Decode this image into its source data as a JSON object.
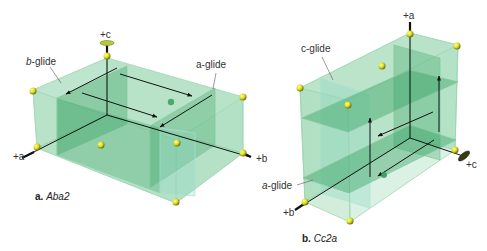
{
  "figures": [
    {
      "id": "a",
      "caption_letter": "a.",
      "caption_name": "Aba2",
      "axes": {
        "a": "+a",
        "b": "+b",
        "c": "+c"
      },
      "labels": {
        "glide1": "b-glide",
        "glide1_italic": "b",
        "glide1_rest": "-glide",
        "glide2": "a-glide",
        "glide2_italic": "a",
        "glide2_rest": "-glide"
      }
    },
    {
      "id": "b",
      "caption_letter": "b.",
      "caption_name": "Cc2a",
      "axes": {
        "a": "+a",
        "b": "+b",
        "c": "+c"
      },
      "labels": {
        "glide1": "c-glide",
        "glide1_italic": "c",
        "glide1_rest": "-glide",
        "glide2": "a-glide",
        "glide2_italic": "a",
        "glide2_rest": "-glide"
      }
    }
  ],
  "colors": {
    "plane_fill": "#3fae6a",
    "plane_edge": "#8fd0a8",
    "inner_plane": "#2e9e5c",
    "atom": "#e6e632",
    "axis": "#111111",
    "background": "#ffffff"
  }
}
